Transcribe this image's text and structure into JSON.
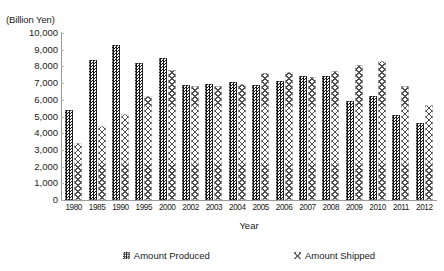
{
  "chart_data": {
    "type": "bar",
    "title": "",
    "xlabel": "Year",
    "ylabel": "(Billion Yen)",
    "unit_caption": "(Billion Yen)",
    "ylim": [
      0,
      10000
    ],
    "ytick_step": 1000,
    "ytick_labels": [
      "10,000",
      "9,000",
      "8,000",
      "7,000",
      "6,000",
      "5,000",
      "4,000",
      "3,000",
      "2,000",
      "1,000",
      "0"
    ],
    "ytick_values": [
      10000,
      9000,
      8000,
      7000,
      6000,
      5000,
      4000,
      3000,
      2000,
      1000,
      0
    ],
    "grid": false,
    "legend_position": "bottom",
    "categories": [
      "1980",
      "1985",
      "1990",
      "1995",
      "2000",
      "2002",
      "2003",
      "2004",
      "2005",
      "2006",
      "2007",
      "2008",
      "2009",
      "2010",
      "2011",
      "2012"
    ],
    "series": [
      {
        "name": "Amount Produced",
        "pattern": "dark-checker",
        "color": "#151515",
        "values": [
          5400,
          8400,
          9300,
          8200,
          8500,
          6900,
          6950,
          7050,
          6900,
          7150,
          7450,
          7450,
          5950,
          6200,
          5100,
          4600
        ]
      },
      {
        "name": "Amount Shipped",
        "pattern": "light-cross-hatch",
        "color": "#4d4d4d",
        "values": [
          3400,
          4450,
          5150,
          6250,
          7800,
          6800,
          6850,
          6950,
          7600,
          7650,
          7350,
          7700,
          8100,
          8300,
          6800,
          5700
        ]
      }
    ]
  },
  "legend": {
    "items": [
      {
        "label": "Amount Produced"
      },
      {
        "label": "Amount Shipped"
      }
    ]
  }
}
